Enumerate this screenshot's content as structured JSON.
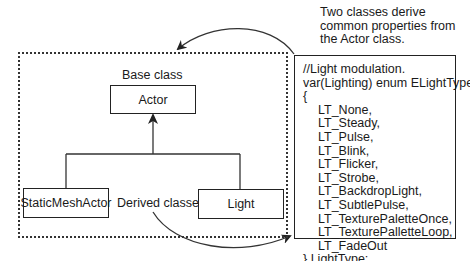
{
  "annotation": {
    "lines": [
      "Two classes derive",
      "common properties from",
      "the Actor class."
    ]
  },
  "diagram": {
    "base_label": "Base class",
    "base_class": "Actor",
    "derived_label": "Derived classes",
    "derived_classes": [
      "StaticMeshActor",
      "Light"
    ]
  },
  "code": {
    "header": [
      "//Light modulation.",
      "var(Lighting) enum ELightType",
      "{"
    ],
    "items": [
      "LT_None,",
      "LT_Steady,",
      "LT_Pulse,",
      "LT_Blink,",
      "LT_Flicker,",
      "LT_Strobe,",
      "LT_BackdropLight,",
      "LT_SubtlePulse,",
      "LT_TexturePaletteOnce,",
      "LT_TexturePalletteLoop,",
      "LT_FadeOut"
    ],
    "footer": "} LightType;"
  },
  "colors": {
    "line": "#222222",
    "background": "#ffffff"
  }
}
